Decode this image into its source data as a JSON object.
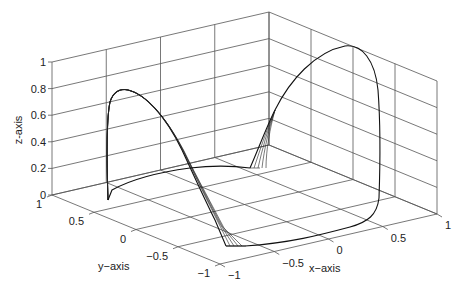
{
  "chart_data": {
    "type": "line3d",
    "title": "",
    "xlabel": "x-axis",
    "ylabel": "y-axis",
    "zlabel": "z-axis",
    "xlim": [
      -1,
      1
    ],
    "ylim": [
      -1,
      1
    ],
    "zlim": [
      0,
      1
    ],
    "x_ticks": [
      "-1",
      "-0.5",
      "0",
      "0.5",
      "1"
    ],
    "y_ticks": [
      "-1",
      "-0.5",
      "0",
      "0.5",
      "1"
    ],
    "z_ticks": [
      "0",
      "0.2",
      "0.4",
      "0.6",
      "0.8",
      "1"
    ],
    "grid": true,
    "legend": null,
    "series": [
      {
        "name": "trajectory-bundle-arch-left",
        "description": "Bundle of near-identical trajectories rising from floor near y=1 side, peaking around z≈0.8, descending to floor near x≈-1, y≈-1",
        "points_xyz": [
          [
            -1,
            0.55,
            0.0
          ],
          [
            -1,
            0.55,
            0.75
          ],
          [
            -0.85,
            0.6,
            0.8
          ],
          [
            -0.5,
            0.2,
            0.55
          ],
          [
            -0.3,
            -0.3,
            0.2
          ],
          [
            -0.95,
            -0.9,
            0.0
          ]
        ]
      },
      {
        "name": "trajectory-bundle-arch-right",
        "description": "Bundle of trajectories rising from floor near center, peaking near z≈1 at x≈1, descending along x≈1 wall and returning along floor",
        "points_xyz": [
          [
            0.1,
            0.7,
            0.0
          ],
          [
            0.5,
            0.8,
            0.6
          ],
          [
            0.8,
            0.8,
            1.0
          ],
          [
            1.0,
            0.3,
            0.7
          ],
          [
            1.0,
            0.0,
            0.05
          ],
          [
            0.0,
            -0.6,
            0.0
          ],
          [
            -0.9,
            -0.9,
            0.0
          ]
        ]
      },
      {
        "name": "floor-segment",
        "description": "Floor-level path connecting left arch base to right arch base",
        "points_xyz": [
          [
            -1,
            0.55,
            0.0
          ],
          [
            -0.3,
            0.55,
            0.0
          ],
          [
            0.1,
            0.7,
            0.0
          ]
        ]
      }
    ]
  },
  "labels": {
    "x_axis": "x-axis",
    "y_axis": "y-axis",
    "z_axis": "z-axis"
  }
}
